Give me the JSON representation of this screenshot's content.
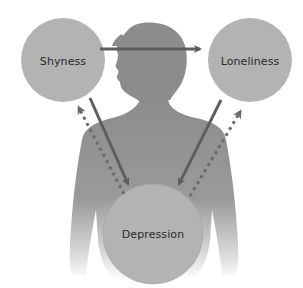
{
  "diagram": {
    "nodes": [
      {
        "id": "shyness",
        "label": "Shyness",
        "cx": 63,
        "cy": 60,
        "r": 42
      },
      {
        "id": "loneliness",
        "label": "Loneliness",
        "cx": 250,
        "cy": 60,
        "r": 42
      },
      {
        "id": "depression",
        "label": "Depression",
        "cx": 153,
        "cy": 234,
        "r": 50
      }
    ],
    "edges": [
      {
        "from": "shyness",
        "to": "loneliness",
        "style": "solid"
      },
      {
        "from": "shyness",
        "to": "depression",
        "style": "solid"
      },
      {
        "from": "depression",
        "to": "shyness",
        "style": "dashed"
      },
      {
        "from": "loneliness",
        "to": "depression",
        "style": "solid"
      },
      {
        "from": "depression",
        "to": "loneliness",
        "style": "dashed"
      }
    ],
    "colors": {
      "node_fill": "#b3b3b3",
      "silhouette": "#8c8c8c",
      "arrow": "#5e5e5e",
      "text": "#2a2a2a",
      "background": "#ffffff"
    }
  }
}
